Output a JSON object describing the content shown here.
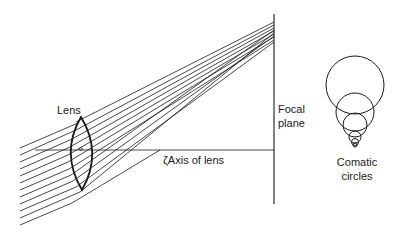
{
  "figure": {
    "labels": {
      "lens": "Lens",
      "axis": "ζAxis of lens",
      "focal_line1": "Focal",
      "focal_line2": "plane",
      "coma_line1": "Comatic",
      "coma_line2": "circles"
    },
    "colors": {
      "ink": "#1a1a1a",
      "background": "#ffffff"
    }
  }
}
